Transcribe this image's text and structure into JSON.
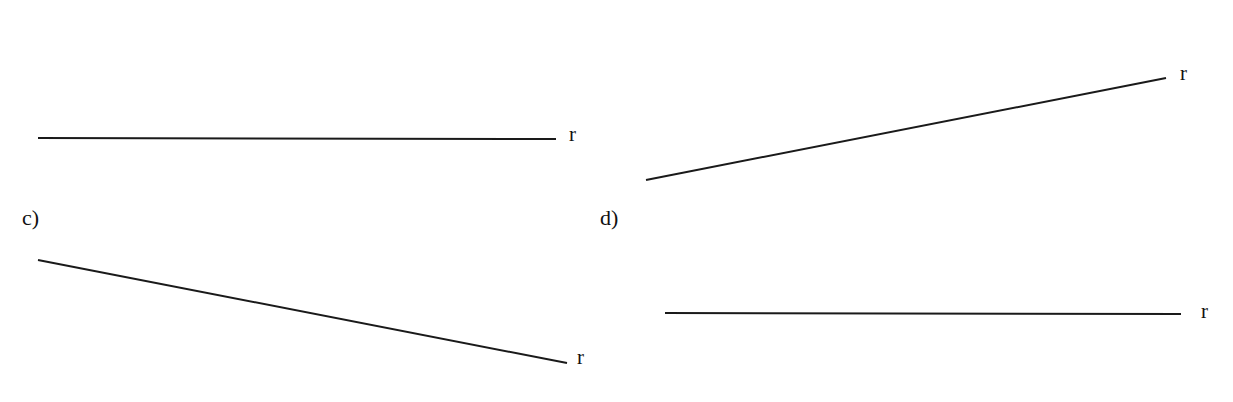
{
  "panels": [
    {
      "id": "a",
      "label": "",
      "line": {
        "x1": 38,
        "y1": 138,
        "x2": 556,
        "y2": 139
      },
      "line_label": "r",
      "line_label_pos": {
        "x": 569,
        "y": 124
      }
    },
    {
      "id": "b",
      "label": "",
      "line": {
        "x1": 646,
        "y1": 180,
        "x2": 1166,
        "y2": 78
      },
      "line_label": "r",
      "line_label_pos": {
        "x": 1180,
        "y": 63
      }
    },
    {
      "id": "c",
      "label": "c)",
      "label_pos": {
        "x": 22,
        "y": 207
      },
      "line": {
        "x1": 38,
        "y1": 260,
        "x2": 567,
        "y2": 363
      },
      "line_label": "r",
      "line_label_pos": {
        "x": 577,
        "y": 347
      }
    },
    {
      "id": "d",
      "label": "d)",
      "label_pos": {
        "x": 600,
        "y": 207
      },
      "line": {
        "x1": 665,
        "y1": 313,
        "x2": 1181,
        "y2": 314
      },
      "line_label": "r",
      "line_label_pos": {
        "x": 1201,
        "y": 301
      }
    }
  ],
  "style": {
    "line_color": "#1a1a1a",
    "line_width": 2
  }
}
